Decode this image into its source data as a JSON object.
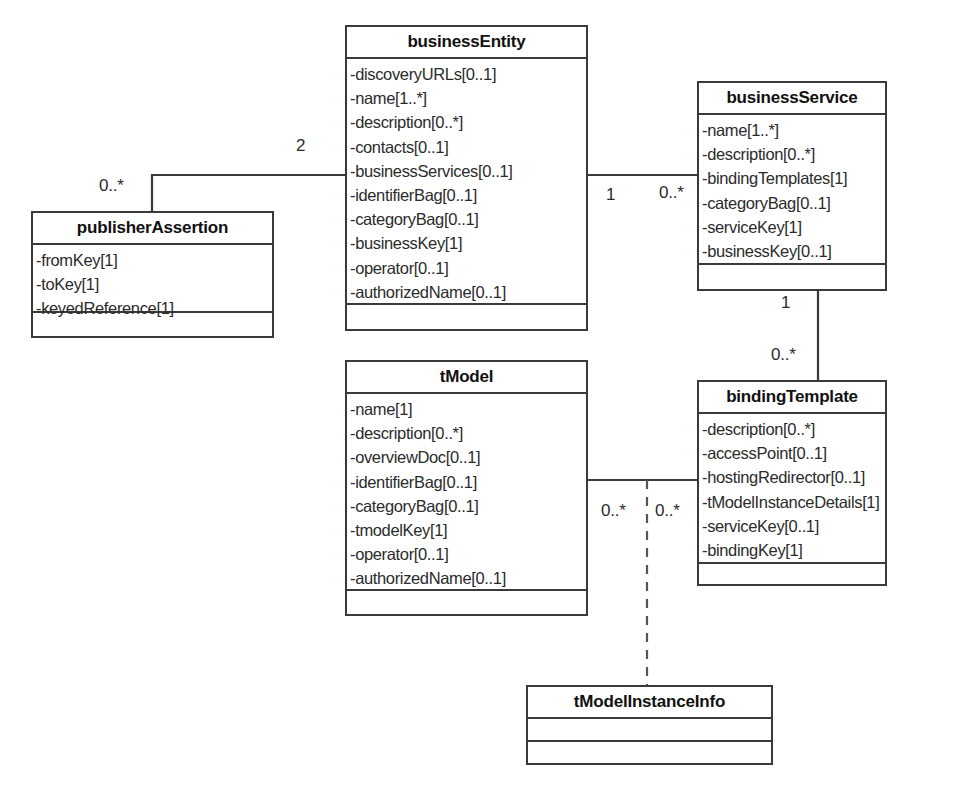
{
  "diagram": {
    "type": "uml-class-diagram",
    "classes": [
      {
        "id": "businessEntity",
        "name": "businessEntity",
        "attributes": [
          "-discoveryURLs[0..1]",
          "-name[1..*]",
          "-description[0..*]",
          "-contacts[0..1]",
          "-businessServices[0..1]",
          "-identifierBag[0..1]",
          "-categoryBag[0..1]",
          "-businessKey[1]",
          "-operator[0..1]",
          "-authorizedName[0..1]"
        ],
        "operations": []
      },
      {
        "id": "businessService",
        "name": "businessService",
        "attributes": [
          "-name[1..*]",
          "-description[0..*]",
          "-bindingTemplates[1]",
          "-categoryBag[0..1]",
          "-serviceKey[1]",
          "-businessKey[0..1]"
        ],
        "operations": []
      },
      {
        "id": "publisherAssertion",
        "name": "publisherAssertion",
        "attributes": [
          "-fromKey[1]",
          "-toKey[1]",
          "-keyedReference[1]"
        ],
        "operations": []
      },
      {
        "id": "tModel",
        "name": "tModel",
        "attributes": [
          "-name[1]",
          "-description[0..*]",
          "-overviewDoc[0..1]",
          "-identifierBag[0..1]",
          "-categoryBag[0..1]",
          "-tmodelKey[1]",
          "-operator[0..1]",
          "-authorizedName[0..1]"
        ],
        "operations": []
      },
      {
        "id": "bindingTemplate",
        "name": "bindingTemplate",
        "attributes": [
          "-description[0..*]",
          "-accessPoint[0..1]",
          "-hostingRedirector[0..1]",
          "-tModelInstanceDetails[1]",
          "-serviceKey[0..1]",
          "-bindingKey[1]"
        ],
        "operations": []
      },
      {
        "id": "tModelInstanceInfo",
        "name": "tModelInstanceInfo",
        "attributes": [],
        "operations": []
      }
    ],
    "associations": [
      {
        "id": "assoc-entity-assertion",
        "from": "businessEntity",
        "to": "publisherAssertion",
        "style": "solid",
        "from_multiplicity": "2",
        "to_multiplicity": "0..*"
      },
      {
        "id": "assoc-entity-service",
        "from": "businessEntity",
        "to": "businessService",
        "style": "solid",
        "from_multiplicity": "1",
        "to_multiplicity": "0..*"
      },
      {
        "id": "assoc-service-binding",
        "from": "businessService",
        "to": "bindingTemplate",
        "style": "solid",
        "from_multiplicity": "1",
        "to_multiplicity": "0..*"
      },
      {
        "id": "assoc-tmodel-binding",
        "from": "tModel",
        "to": "bindingTemplate",
        "style": "solid",
        "from_multiplicity": "0..*",
        "to_multiplicity": "0..*"
      },
      {
        "id": "assoc-instanceinfo",
        "from": "assoc-tmodel-binding",
        "to": "tModelInstanceInfo",
        "style": "dashed",
        "from_multiplicity": "",
        "to_multiplicity": ""
      }
    ],
    "multiplicity_labels": [
      {
        "text": "2",
        "x": 296,
        "y": 136
      },
      {
        "text": "0..*",
        "x": 99,
        "y": 176
      },
      {
        "text": "1",
        "x": 606,
        "y": 185
      },
      {
        "text": "0..*",
        "x": 659,
        "y": 183
      },
      {
        "text": "1",
        "x": 781,
        "y": 293
      },
      {
        "text": "0..*",
        "x": 771,
        "y": 345
      },
      {
        "text": "0..*",
        "x": 601,
        "y": 501
      },
      {
        "text": "0..*",
        "x": 655,
        "y": 501
      }
    ],
    "colors": {
      "stroke": "#3a3a3a",
      "background": "#ffffff",
      "text": "#2b2b2b",
      "title_text": "#111111"
    }
  }
}
